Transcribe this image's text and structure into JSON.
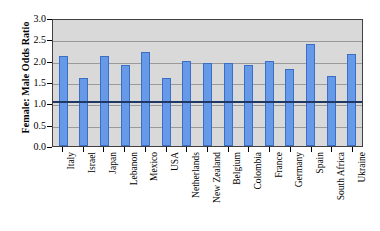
{
  "chart_data": {
    "type": "bar",
    "title": "",
    "xlabel": "",
    "ylabel": "Female: Male Odds Ratio",
    "ylim": [
      0.0,
      3.0
    ],
    "ytick_labels": [
      "3.0",
      "2.5",
      "2.0",
      "1.5",
      "1.0",
      "0.5",
      "0.0"
    ],
    "ytick_values": [
      3.0,
      2.5,
      2.0,
      1.5,
      1.0,
      0.5,
      0.0
    ],
    "grid": true,
    "legend": "none",
    "reference_line": {
      "value": 1.1,
      "color": "#1f3864",
      "label": ""
    },
    "bar_color": "#6699e8",
    "bar_edge_color": "#3b6fc4",
    "plot_background": "#d9d9d9",
    "categories": [
      "Italy",
      "Israel",
      "Japan",
      "Lebanon",
      "Mexico",
      "USA",
      "Netherlands",
      "New Zealand",
      "Belgium",
      "Colombia",
      "France",
      "Germany",
      "Spain",
      "South Africa",
      "Ukraine"
    ],
    "values": [
      2.1,
      1.6,
      2.1,
      1.9,
      2.2,
      1.6,
      2.0,
      1.95,
      1.95,
      1.9,
      2.0,
      1.8,
      2.4,
      1.65,
      2.15
    ]
  }
}
